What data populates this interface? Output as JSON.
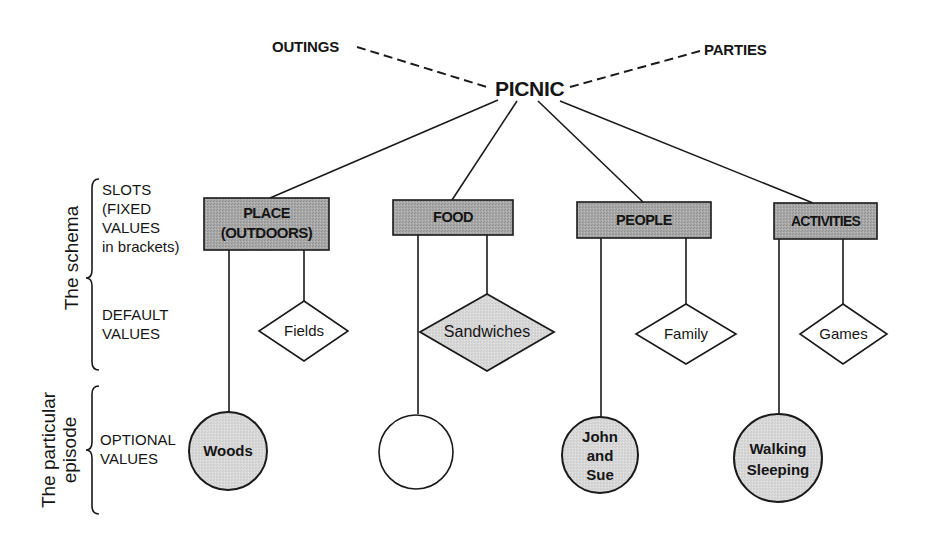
{
  "diagram": {
    "root": "PICNIC",
    "related": [
      "OUTINGS",
      "PARTIES"
    ],
    "side_labels": {
      "slots": [
        "SLOTS",
        "(FIXED",
        "VALUES",
        "in brackets)"
      ],
      "default": [
        "DEFAULT",
        "VALUES"
      ],
      "optional": [
        "OPTIONAL",
        "VALUES"
      ],
      "schema": "The schema",
      "episode_line1": "The particular",
      "episode_line2": "episode"
    },
    "slots": [
      {
        "name": "PLACE",
        "fixed": "(OUTDOORS)",
        "default": "Fields",
        "default_shaded": false,
        "optional": "Woods",
        "optional_2": "",
        "optional_3": "",
        "optional_shaded": true
      },
      {
        "name": "FOOD",
        "fixed": "",
        "default": "Sandwiches",
        "default_shaded": true,
        "optional": "",
        "optional_2": "",
        "optional_3": "",
        "optional_shaded": false
      },
      {
        "name": "PEOPLE",
        "fixed": "",
        "default": "Family",
        "default_shaded": false,
        "optional": "John",
        "optional_2": "and",
        "optional_3": "Sue",
        "optional_shaded": true
      },
      {
        "name": "ACTIVITIES",
        "fixed": "",
        "default": "Games",
        "default_shaded": false,
        "optional": "Walking",
        "optional_2": "Sleeping",
        "optional_3": "",
        "optional_shaded": true
      }
    ],
    "colors": {
      "slot_fill": "#a9a9a9",
      "shaded_fill": "#d6d6d6",
      "line": "#1a1a1a",
      "background": "#ffffff"
    }
  }
}
